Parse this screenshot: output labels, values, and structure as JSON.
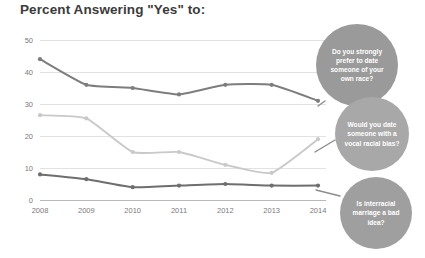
{
  "chart_data": {
    "type": "line",
    "title": "Percent Answering \"Yes\" to:",
    "xlabel": "",
    "ylabel": "",
    "categories": [
      "2008",
      "2009",
      "2010",
      "2011",
      "2012",
      "2013",
      "2014"
    ],
    "x": [
      2008,
      2009,
      2010,
      2011,
      2012,
      2013,
      2014
    ],
    "ylim": [
      0,
      50
    ],
    "yticks": [
      0,
      10,
      20,
      30,
      40,
      50
    ],
    "ytick_labels": [
      "0",
      "10",
      "20",
      "30",
      "40",
      "50"
    ],
    "grid": true,
    "legend_position": "annotation-bubbles-right",
    "series": [
      {
        "name": "Do you strongly prefer to date someone of your own race?",
        "color": "#7d7d7d",
        "values": [
          44,
          36,
          35,
          33,
          36,
          36,
          31
        ]
      },
      {
        "name": "Would you date someone with a vocal racial bias?",
        "color": "#c9c9c9",
        "values": [
          26.5,
          25.5,
          15,
          15,
          11,
          8.5,
          19
        ]
      },
      {
        "name": "Is interracial marriage a bad idea?",
        "color": "#6e6e6e",
        "values": [
          8,
          6.5,
          4,
          4.5,
          5,
          4.5,
          4.5
        ]
      }
    ],
    "annotations": [
      {
        "id": "bubble-own-race",
        "lines": [
          "Do you strongly",
          "prefer to date",
          "someone of your",
          "own race?"
        ],
        "color": "#9a9a9a",
        "cx": 357,
        "cy": 65,
        "r": 41
      },
      {
        "id": "bubble-vocal-bias",
        "lines": [
          "Would you date",
          "someone with a",
          "vocal racial bias?"
        ],
        "color": "#a8a8a8",
        "cx": 372,
        "cy": 134,
        "r": 37
      },
      {
        "id": "bubble-interracial",
        "lines": [
          "Is interracial",
          "marriage a bad",
          "idea?"
        ],
        "color": "#9f9f9f",
        "cx": 376,
        "cy": 213,
        "r": 36
      }
    ],
    "leaders": [
      {
        "id": "leader-own-race",
        "from": [
          318,
          106
        ],
        "to": [
          325,
          101
        ]
      },
      {
        "id": "leader-vocal-bias",
        "from": [
          315,
          152
        ],
        "to": [
          335,
          140
        ]
      },
      {
        "id": "leader-interracial",
        "from": [
          316,
          190
        ],
        "to": [
          340,
          196
        ]
      }
    ]
  }
}
